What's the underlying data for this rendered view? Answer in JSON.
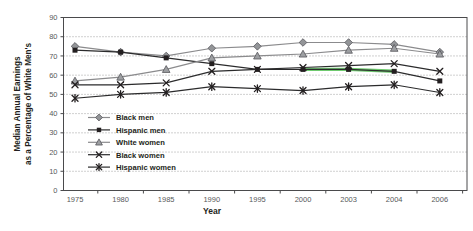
{
  "chart_data": {
    "type": "line",
    "title": "",
    "xlabel": "Year",
    "ylabel_line1": "Median Annual Earnings",
    "ylabel_line2": "as a Percentage of White Men's",
    "x_categories": [
      "1975",
      "1980",
      "1985",
      "1990",
      "1995",
      "2000",
      "2003",
      "2004",
      "2006"
    ],
    "yticks": [
      0,
      10,
      20,
      30,
      40,
      50,
      60,
      70,
      80,
      90
    ],
    "ylim": [
      0,
      90
    ],
    "grid": "horizontal-dotted",
    "legend_position": "inside-lower-left",
    "colors": {
      "axis": "#4a4a4c",
      "grid": "#8a8a8a",
      "tick_labels": "#58595b",
      "text": "#231f20",
      "gray_series": "#8b8b8d",
      "black_series": "#2b2b2c",
      "highlight_green": "#6fca6f"
    },
    "series": [
      {
        "name": "Black men",
        "marker": "diamond",
        "color": "#8b8b8d",
        "marker_fill": "#939598",
        "values": [
          75,
          72,
          70,
          74,
          75,
          77,
          77,
          76,
          72
        ]
      },
      {
        "name": "Hispanic men",
        "marker": "square",
        "color": "#2b2b2c",
        "marker_fill": "#231f20",
        "values": [
          73,
          72,
          69,
          66,
          63,
          63,
          63,
          62,
          57
        ]
      },
      {
        "name": "White women",
        "marker": "triangle",
        "color": "#8b8b8d",
        "marker_fill": "#9d9fa2",
        "values": [
          57,
          59,
          63,
          69,
          70,
          71,
          73,
          74,
          71
        ]
      },
      {
        "name": "Black women",
        "marker": "x",
        "color": "#2b2b2c",
        "marker_fill": "#231f20",
        "values": [
          55,
          55,
          56,
          62,
          63,
          64,
          65,
          66,
          62
        ]
      },
      {
        "name": "Hispanic women",
        "marker": "asterisk",
        "color": "#2b2b2c",
        "marker_fill": "#231f20",
        "values": [
          48,
          50,
          51,
          54,
          53,
          52,
          54,
          55,
          51
        ]
      }
    ],
    "highlight_segment": {
      "series": "Hispanic men",
      "x_from": "2000",
      "x_to": "2004",
      "color": "#6fca6f"
    }
  }
}
